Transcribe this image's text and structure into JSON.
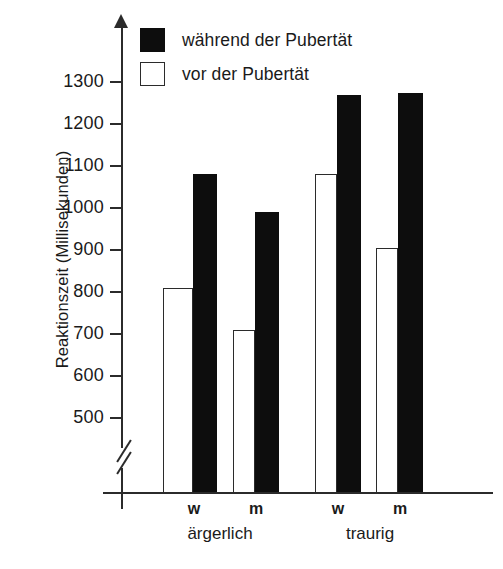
{
  "chart_data": {
    "type": "bar",
    "title": "",
    "xlabel": "",
    "ylabel": "Reaktionszeit (Millisekunden)",
    "ylim": [
      450,
      1350
    ],
    "yticks": [
      500,
      600,
      700,
      800,
      900,
      1000,
      1100,
      1200,
      1300
    ],
    "ytick_labels": [
      "500",
      "600",
      "700",
      "800",
      "900",
      "1000",
      "1100",
      "1200",
      "1300"
    ],
    "axis_break": true,
    "grid": false,
    "legend_position": "top-left",
    "groups": [
      {
        "label": "ärgerlich",
        "categories": [
          "w",
          "m"
        ]
      },
      {
        "label": "traurig",
        "categories": [
          "w",
          "m"
        ]
      }
    ],
    "categories": [
      "w (ärgerlich)",
      "m (ärgerlich)",
      "w (traurig)",
      "m (traurig)"
    ],
    "series": [
      {
        "name": "vor der Pubertät",
        "fill": "#ffffff",
        "edge": "#2b2b2b",
        "values": [
          810,
          710,
          1080,
          905
        ]
      },
      {
        "name": "während der Pubertät",
        "fill": "#0d0d0d",
        "edge": "#0d0d0d",
        "values": [
          1080,
          990,
          1270,
          1273
        ]
      }
    ],
    "bars": [
      {
        "group": "ärgerlich",
        "category": "w",
        "series": "vor der Pubertät",
        "value": 810
      },
      {
        "group": "ärgerlich",
        "category": "w",
        "series": "während der Pubertät",
        "value": 1080
      },
      {
        "group": "ärgerlich",
        "category": "m",
        "series": "vor der Pubertät",
        "value": 710
      },
      {
        "group": "ärgerlich",
        "category": "m",
        "series": "während der Pubertät",
        "value": 990
      },
      {
        "group": "traurig",
        "category": "w",
        "series": "vor der Pubertät",
        "value": 1080
      },
      {
        "group": "traurig",
        "category": "w",
        "series": "während der Pubertät",
        "value": 1270
      },
      {
        "group": "traurig",
        "category": "m",
        "series": "vor der Pubertät",
        "value": 905
      },
      {
        "group": "traurig",
        "category": "m",
        "series": "während der Pubertät",
        "value": 1273
      }
    ]
  },
  "legend": {
    "items": [
      {
        "label": "während der Pubertät",
        "style": "filled"
      },
      {
        "label": "vor der Pubertät",
        "style": "open"
      }
    ]
  },
  "axis": {
    "y_title": "Reaktionszeit (Millisekunden)",
    "ticks": [
      "1300",
      "1200",
      "1100",
      "1000",
      "900",
      "800",
      "700",
      "600",
      "500"
    ]
  },
  "categories_row": [
    {
      "text": "w"
    },
    {
      "text": "m"
    },
    {
      "text": "w"
    },
    {
      "text": "m"
    }
  ],
  "groups_row": [
    {
      "text": "ärgerlich"
    },
    {
      "text": "traurig"
    }
  ],
  "colors": {
    "bar_filled": "#0d0d0d",
    "bar_open": "#ffffff",
    "axis": "#2b2b2b",
    "text": "#1a1a1a",
    "background": "#ffffff"
  }
}
